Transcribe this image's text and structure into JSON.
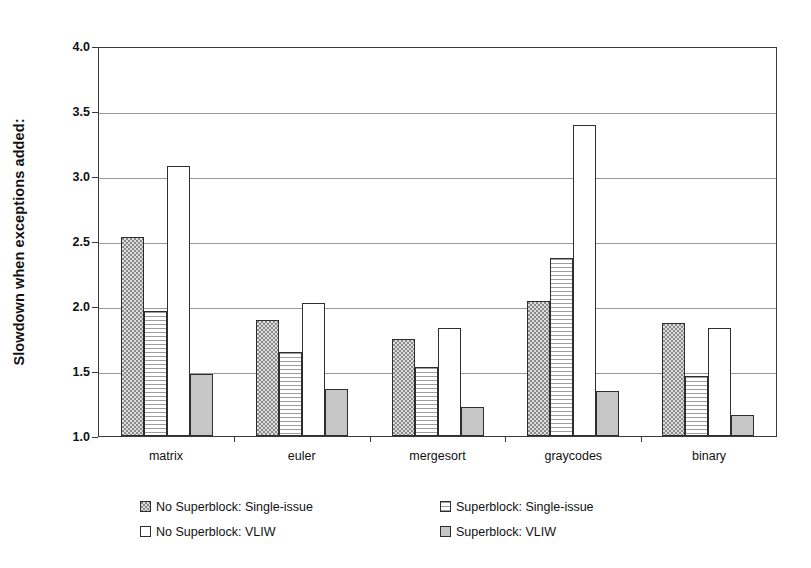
{
  "chart_data": {
    "type": "bar",
    "title": "",
    "xlabel": "",
    "ylabel": "Slowdown when exceptions added:",
    "categories": [
      "matrix",
      "euler",
      "mergesort",
      "graycodes",
      "binary"
    ],
    "series": [
      {
        "name": "No Superblock: Single-issue",
        "swatch": "dots",
        "values": [
          2.53,
          1.89,
          1.75,
          2.04,
          1.87
        ]
      },
      {
        "name": "Superblock: Single-issue",
        "swatch": "hlines",
        "values": [
          1.96,
          1.65,
          1.53,
          2.37,
          1.46
        ]
      },
      {
        "name": "No Superblock: VLIW",
        "swatch": "white",
        "values": [
          3.08,
          2.02,
          1.83,
          3.39,
          1.83
        ]
      },
      {
        "name": "Superblock: VLIW",
        "swatch": "grey",
        "values": [
          1.48,
          1.36,
          1.22,
          1.35,
          1.16
        ]
      }
    ],
    "ylim": [
      1.0,
      4.0
    ],
    "yticks": [
      "1.0",
      "1.5",
      "2.0",
      "2.5",
      "3.0",
      "3.5",
      "4.0"
    ],
    "ytick_values": [
      1.0,
      1.5,
      2.0,
      2.5,
      3.0,
      3.5,
      4.0
    ],
    "grid": true,
    "legend_position": "bottom",
    "colors": {
      "bar_outline": "#2e2e2e",
      "gridline": "#9a9a9a",
      "axis": "#3a3a3a",
      "pattern_dots": "#dedede",
      "pattern_hlines": "#ffffff",
      "pattern_white": "#ffffff",
      "pattern_grey": "#c6c6c6"
    }
  },
  "legend": {
    "items": [
      {
        "label": "No Superblock: Single-issue",
        "swatch": "dots"
      },
      {
        "label": "Superblock: Single-issue",
        "swatch": "hlines"
      },
      {
        "label": "No Superblock: VLIW",
        "swatch": "white"
      },
      {
        "label": "Superblock: VLIW",
        "swatch": "grey"
      }
    ]
  }
}
